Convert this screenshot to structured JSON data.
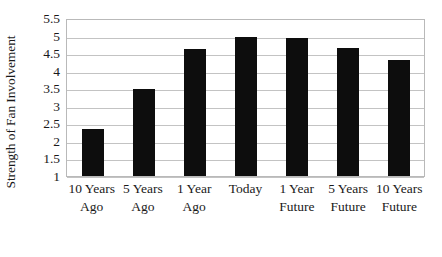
{
  "chart_data": {
    "type": "bar",
    "title": "",
    "subtitle": "",
    "xlabel": "",
    "ylabel": "Strength of Fan Involvement",
    "categories": [
      "10 Years Ago",
      "5 Years Ago",
      "1 Year Ago",
      "Today",
      "1 Year Future",
      "5 Years Future",
      "10 Years Future"
    ],
    "values": [
      2.33,
      3.48,
      4.63,
      4.95,
      4.94,
      4.64,
      4.31
    ],
    "ylim": [
      1,
      5.5
    ],
    "ytick_labels": [
      "5.5",
      "5",
      "4.5",
      "4",
      "3.5",
      "3",
      "2.5",
      "2",
      "1.5",
      "1"
    ],
    "ytick_values": [
      5.5,
      5,
      4.5,
      4,
      3.5,
      3,
      2.5,
      2,
      1.5,
      1
    ],
    "grid": true,
    "legend": "none",
    "bar_color": "#0d0d0d",
    "grid_color": "#c3c3c3",
    "axis_color": "#b9b9b9",
    "background": "#ffffff"
  },
  "axis": {
    "y_title": "Strength of Fan Involvement"
  }
}
